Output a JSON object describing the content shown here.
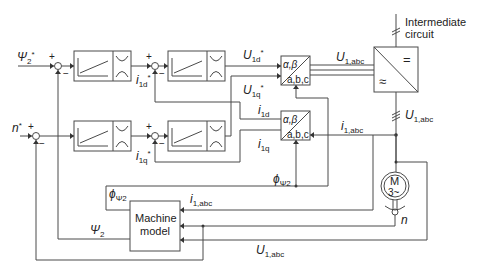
{
  "diagram": {
    "inputs": {
      "flux_ref": {
        "base": "Ψ",
        "sub": "2",
        "sup": "*"
      },
      "speed_ref": {
        "base": "n",
        "sup": "*"
      }
    },
    "signals": {
      "i1d_ref": {
        "base": "i",
        "sub": "1d",
        "sup": "*"
      },
      "i1q_ref": {
        "base": "i",
        "sub": "1q",
        "sup": "*"
      },
      "U1d_ref": {
        "base": "U",
        "sub": "1d",
        "sup": "*"
      },
      "U1q_ref": {
        "base": "U",
        "sub": "1q",
        "sup": "*"
      },
      "i1d": {
        "base": "i",
        "sub": "1d"
      },
      "i1q": {
        "base": "i",
        "sub": "1q"
      },
      "U1abc_top": {
        "base": "U",
        "sub": "1,abc"
      },
      "U1abc_right": {
        "base": "U",
        "sub": "1,abc"
      },
      "U1abc_bottom": {
        "base": "U",
        "sub": "1,abc"
      },
      "i1abc_right": {
        "base": "i",
        "sub": "1,abc"
      },
      "i1abc_model": {
        "base": "i",
        "sub": "1,abc"
      },
      "phi_psi2_center": {
        "base": "ϕ",
        "sub": "Ψ2"
      },
      "phi_psi2_left": {
        "base": "ϕ",
        "sub": "Ψ2"
      },
      "psi2_feedback": {
        "base": "Ψ",
        "sub": "2"
      },
      "speed_n": {
        "base": "n"
      }
    },
    "blocks": {
      "transform_top": {
        "top": "α,β",
        "bottom": "a,b,c"
      },
      "transform_bottom": {
        "top": "α,β",
        "bottom": "a,b,c"
      },
      "inverter": {
        "dc_symbol": "=",
        "ac_symbol": "≈"
      },
      "dc_link_label_line1": "Intermediate",
      "dc_link_label_line2": "circuit",
      "motor": {
        "line1": "M",
        "line2": "3~"
      },
      "machine_model_line1": "Machine",
      "machine_model_line2": "model"
    },
    "summing_signs": {
      "plus": "+",
      "minus": "−"
    }
  }
}
